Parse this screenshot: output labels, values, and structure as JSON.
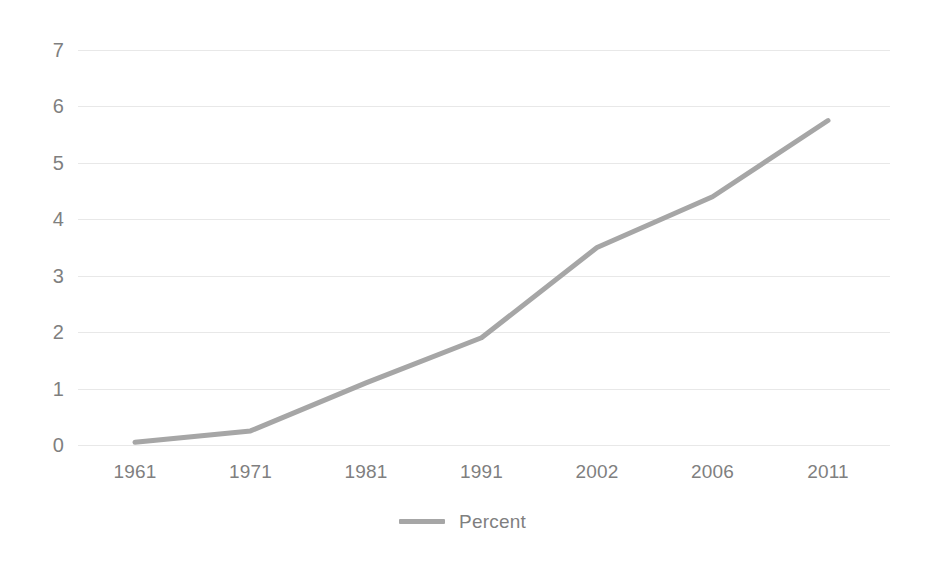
{
  "chart_data": {
    "type": "line",
    "title": "",
    "subtitle": "",
    "xlabel": "",
    "ylabel": "",
    "categories": [
      "1961",
      "1971",
      "1981",
      "1991",
      "2002",
      "2006",
      "2011"
    ],
    "series": [
      {
        "name": "Percent",
        "color": "#a6a6a6",
        "values": [
          0.05,
          0.25,
          1.1,
          1.9,
          3.5,
          4.4,
          5.75
        ]
      }
    ],
    "ylim": [
      0,
      7
    ],
    "y_ticks": [
      "0",
      "1",
      "2",
      "3",
      "4",
      "5",
      "6",
      "7"
    ],
    "grid": true,
    "grid_color": "#e8e8e8",
    "legend_position": "bottom",
    "legend": [
      {
        "label": "Percent",
        "color": "#a6a6a6"
      }
    ],
    "axis_label_color": "#7f7f7f",
    "background_color": "#ffffff"
  }
}
